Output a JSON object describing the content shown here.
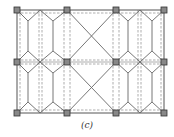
{
  "figure": {
    "caption": "(c)",
    "colors": {
      "frame": "#555555",
      "solid_member": "#666666",
      "dashed_line": "#8a8a8a",
      "node_fill": "#888888",
      "node_stroke": "#333333",
      "background": "#ffffff"
    },
    "grid": {
      "column_x": [
        17,
        67,
        116,
        164
      ],
      "row_y": [
        10,
        62,
        113
      ]
    },
    "nodes": [
      {
        "x": 17,
        "y": 10
      },
      {
        "x": 67,
        "y": 10
      },
      {
        "x": 116,
        "y": 10
      },
      {
        "x": 164,
        "y": 10
      },
      {
        "x": 17,
        "y": 62
      },
      {
        "x": 67,
        "y": 62
      },
      {
        "x": 116,
        "y": 62
      },
      {
        "x": 164,
        "y": 62
      },
      {
        "x": 17,
        "y": 113
      },
      {
        "x": 67,
        "y": 113
      },
      {
        "x": 116,
        "y": 113
      },
      {
        "x": 164,
        "y": 113
      }
    ],
    "bays": [
      {
        "name": "left-bay",
        "pattern": "hexagonal-diamond bracing"
      },
      {
        "name": "middle-bay",
        "pattern": "X cross bracing"
      },
      {
        "name": "right-bay",
        "pattern": "hexagonal-diamond bracing"
      }
    ]
  }
}
